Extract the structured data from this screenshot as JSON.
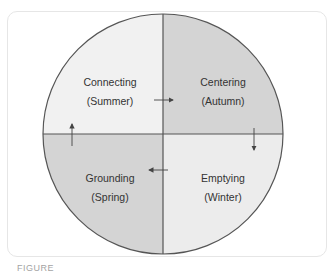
{
  "diagram": {
    "type": "four-quadrant-cycle",
    "colors": {
      "light_fill": "#f1f1f1",
      "dark_fill": "#d4d4d4",
      "line": "#555555",
      "text": "#333333"
    },
    "quadrants": [
      {
        "position": "top-left",
        "title": "Connecting",
        "season": "(Summer)",
        "fill": "light"
      },
      {
        "position": "top-right",
        "title": "Centering",
        "season": "(Autumn)",
        "fill": "dark"
      },
      {
        "position": "bottom-right",
        "title": "Emptying",
        "season": "(Winter)",
        "fill": "light"
      },
      {
        "position": "bottom-left",
        "title": "Grounding",
        "season": "(Spring)",
        "fill": "dark"
      }
    ],
    "arrows": [
      {
        "from": "Connecting",
        "to": "Centering",
        "direction": "right"
      },
      {
        "from": "Centering",
        "to": "Emptying",
        "direction": "down"
      },
      {
        "from": "Emptying",
        "to": "Grounding",
        "direction": "left"
      },
      {
        "from": "Grounding",
        "to": "Connecting",
        "direction": "up"
      }
    ]
  },
  "caption": "FIGURE"
}
